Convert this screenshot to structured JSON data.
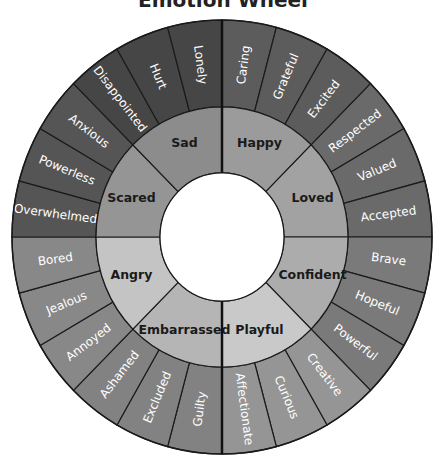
{
  "title": "Emotion Wheel",
  "geometry": {
    "cx": 222,
    "cy": 237,
    "rx_outer": 210,
    "ry_outer": 217,
    "r_middle": 126,
    "r_inner": 62
  },
  "core_emotions": [
    {
      "label": "Happy",
      "inner_color": "#9b9b9b",
      "outer_color": "#5c5c5c",
      "words": [
        "Caring",
        "Grateful",
        "Excited"
      ]
    },
    {
      "label": "Loved",
      "inner_color": "#a2a2a2",
      "outer_color": "#6a6a6a",
      "words": [
        "Respected",
        "Valued",
        "Accepted"
      ]
    },
    {
      "label": "Confident",
      "inner_color": "#acacac",
      "outer_color": "#7a7a7a",
      "words": [
        "Brave",
        "Hopeful",
        "Powerful"
      ]
    },
    {
      "label": "Playful",
      "inner_color": "#c9c9c9",
      "outer_color": "#959595",
      "words": [
        "Creative",
        "Curious",
        "Affectionate"
      ]
    },
    {
      "label": "Embarrassed",
      "inner_color": "#b5b5b5",
      "outer_color": "#828282",
      "words": [
        "Guilty",
        "Excluded",
        "Ashamed"
      ]
    },
    {
      "label": "Angry",
      "inner_color": "#c4c4c4",
      "outer_color": "#888888",
      "words": [
        "Annoyed",
        "Jealous",
        "Bored"
      ]
    },
    {
      "label": "Scared",
      "inner_color": "#959595",
      "outer_color": "#555555",
      "words": [
        "Overwhelmed",
        "Powerless",
        "Anxious"
      ]
    },
    {
      "label": "Sad",
      "inner_color": "#8c8c8c",
      "outer_color": "#464646",
      "words": [
        "Disappointed",
        "Hurt",
        "Lonely"
      ]
    }
  ]
}
